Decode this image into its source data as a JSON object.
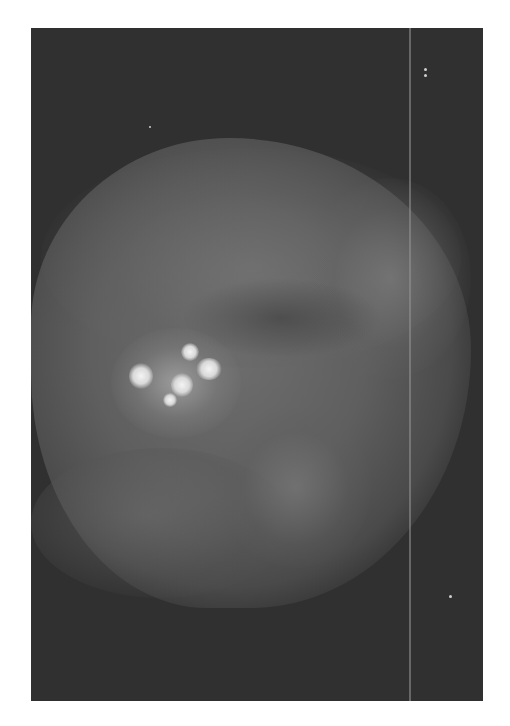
{
  "image": {
    "type": "grayscale fluorescence micrograph",
    "subject": "tissue sample with bright fluorescent foci",
    "colors": {
      "background_page": "#ffffff",
      "background_image": "#303030",
      "tissue": "#6e6e6e",
      "hotspot": "#f4f4f4"
    }
  }
}
